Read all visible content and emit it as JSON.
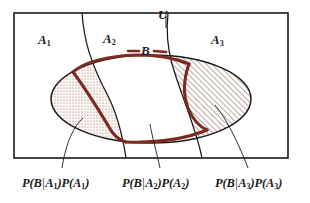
{
  "figure": {
    "kind": "venn-diagram",
    "caption_omitted": true,
    "colors": {
      "universe_border": "#1a1a1a",
      "partition_curve": "#1a1a1a",
      "event_b_curve": "#7d2b22",
      "hatch_color": "#8a5a4a",
      "stipple_color": "#9a6a58",
      "text": "#1a1a1a",
      "background": "#ffffff"
    },
    "universe": {
      "label": "U"
    },
    "partitions": [
      {
        "label": "A",
        "subscript": "1",
        "shading": "stipple"
      },
      {
        "label": "A",
        "subscript": "2",
        "shading": "none"
      },
      {
        "label": "A",
        "subscript": "3",
        "shading": "diagonal-hatch"
      }
    ],
    "event": {
      "label": "B"
    },
    "formulas": [
      {
        "id": "formula-a1",
        "text": "P(B|A₁)P(A₁)",
        "prefix": "P(B",
        "bar": "|",
        "set": "A",
        "sub": "1",
        "middle": ")P(A",
        "sub2": "1",
        "suffix": ")"
      },
      {
        "id": "formula-a2",
        "text": "P(B|A₂)P(A₂)",
        "prefix": "P(B",
        "bar": "|",
        "set": "A",
        "sub": "2",
        "middle": ")P(A",
        "sub2": "2",
        "suffix": ")"
      },
      {
        "id": "formula-a3",
        "text": "P(B|A₃)P(A₃)",
        "prefix": "P(B",
        "bar": "|",
        "set": "A",
        "sub": "3",
        "middle": ")P(A",
        "sub2": "3",
        "suffix": ")"
      }
    ]
  }
}
